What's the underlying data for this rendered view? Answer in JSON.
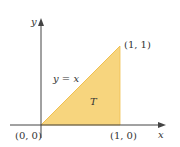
{
  "diagram": {
    "region_label": "T",
    "line_label": "y = x",
    "axes": {
      "x_label": "x",
      "y_label": "y"
    },
    "points": [
      {
        "label": "(0, 0)",
        "x": 0,
        "y": 0
      },
      {
        "label": "(1, 0)",
        "x": 1,
        "y": 0
      },
      {
        "label": "(1, 1)",
        "x": 1,
        "y": 1
      }
    ],
    "colors": {
      "fill": "#F7D57E",
      "edge": "#F0C050",
      "axis": "#444444",
      "text": "#333333"
    }
  }
}
